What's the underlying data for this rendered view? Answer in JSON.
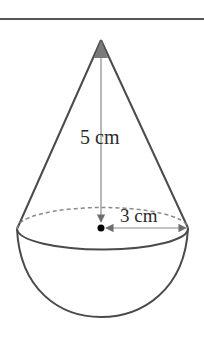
{
  "figure": {
    "labels": {
      "height": "5 cm",
      "radius": "3 cm"
    },
    "measurements": {
      "cone_height_cm": 5,
      "radius_cm": 3
    },
    "colors": {
      "stroke": "#4a4a4a",
      "arrow": "#6e6e6e",
      "center_dot": "#000000",
      "background": "#ffffff"
    }
  }
}
